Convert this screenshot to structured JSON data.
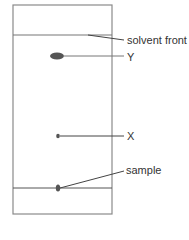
{
  "diagram": {
    "paper": {
      "x": 13,
      "y": 5,
      "width": 99,
      "height": 209,
      "stroke": "#8a8a8a"
    },
    "solvent_front_y": 35,
    "baseline_y": 188,
    "spots": [
      {
        "id": "Y",
        "cx": 57,
        "cy": 56,
        "rx": 7,
        "ry": 3.5,
        "color": "#555555"
      },
      {
        "id": "X",
        "cx": 58,
        "cy": 136,
        "rx": 1.8,
        "ry": 2.2,
        "color": "#555555"
      },
      {
        "id": "sample",
        "cx": 58,
        "cy": 188,
        "rx": 2.2,
        "ry": 3.5,
        "color": "#555555"
      }
    ],
    "labels": {
      "solvent_front": "solvent front",
      "y": "Y",
      "x": "X",
      "sample": "sample"
    },
    "line_color": "#444444"
  }
}
